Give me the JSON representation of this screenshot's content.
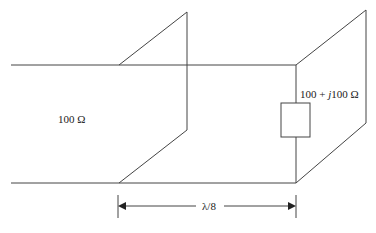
{
  "diagram": {
    "line_impedance_label": "100 Ω",
    "load_label_prefix": "100 + ",
    "load_label_j": "j",
    "load_label_suffix": "100 Ω",
    "length_label": "λ/8",
    "colors": {
      "stroke": "#444444",
      "background": "#ffffff"
    }
  }
}
